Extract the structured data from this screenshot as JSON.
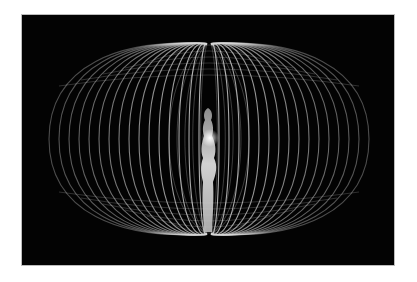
{
  "image": {
    "description": "Glowing white torus energy field of looping lines surrounding a luminous human figure on a black background",
    "subject": "human figure",
    "background_color": "#030303",
    "line_color": "#d8d8d8",
    "page_background": "#ffffff"
  }
}
